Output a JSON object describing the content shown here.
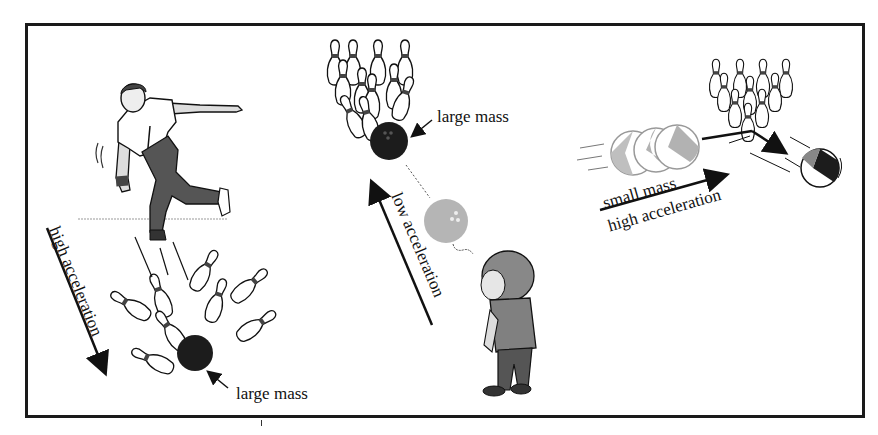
{
  "figure": {
    "panels": [
      {
        "id": "adult-bowler",
        "description": "Adult bowler throws a heavy ball that strikes the pins",
        "labels": {
          "mass": "large mass",
          "acceleration": "high acceleration"
        }
      },
      {
        "id": "child-bowler",
        "description": "Child rolls a heavy ball slowly toward the pins",
        "labels": {
          "mass": "large mass",
          "acceleration": "low acceleration"
        }
      },
      {
        "id": "beach-ball",
        "description": "Light beach ball bounces off the pins",
        "labels": {
          "mass": "small mass",
          "acceleration": "high acceleration"
        }
      }
    ]
  },
  "colors": {
    "frame": "#1a1a1a",
    "ink": "#111111",
    "ball_dark": "#1c1c1c",
    "ball_light": "#b5b5b5",
    "pin_band": "#444444",
    "shirt": "#808080",
    "pants": "#555555"
  }
}
